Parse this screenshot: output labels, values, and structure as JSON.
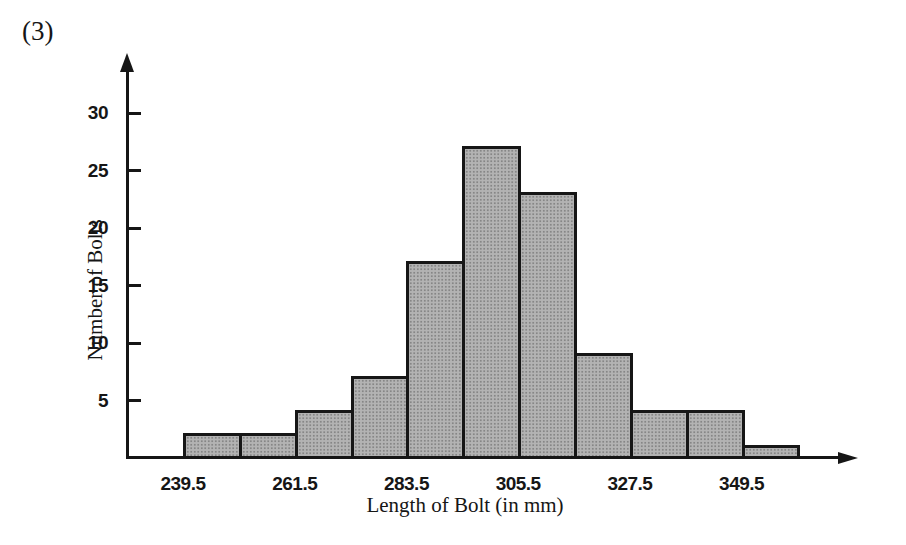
{
  "page": {
    "figure_label": "(3)"
  },
  "chart_data": {
    "type": "bar",
    "subtype": "histogram",
    "title": "",
    "xlabel": "Length of Bolt (in mm)",
    "ylabel": "Number of Bolts",
    "bin_edges": [
      239.5,
      250.5,
      261.5,
      272.5,
      283.5,
      294.5,
      305.5,
      316.5,
      327.5,
      338.5,
      349.5,
      360.5
    ],
    "values": [
      2,
      2,
      4,
      7,
      17,
      27,
      23,
      9,
      4,
      4,
      1
    ],
    "x_tick_labels": [
      "239.5",
      "261.5",
      "283.5",
      "305.5",
      "327.5",
      "349.5"
    ],
    "x_tick_edge_indices": [
      0,
      2,
      4,
      6,
      8,
      10
    ],
    "y_ticks": [
      5,
      10,
      15,
      20,
      25,
      30
    ],
    "ylim": [
      0,
      34
    ],
    "xlim": [
      228.5,
      372.5
    ],
    "grid": false,
    "legend": null,
    "bar_fill_color": "#a8a8a8",
    "bar_outline_color": "#161616",
    "axis_color": "#161616"
  }
}
